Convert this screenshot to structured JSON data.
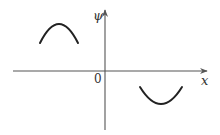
{
  "diagram": {
    "type": "wavefunction-sketch",
    "axes": {
      "x_label": "x",
      "y_label": "ψ",
      "origin_label": "0"
    },
    "curves": [
      {
        "name": "left-arc",
        "shape": "concave-down",
        "region": "x<0, ψ>0"
      },
      {
        "name": "right-arc",
        "shape": "concave-up",
        "region": "x>0, ψ<0"
      }
    ]
  }
}
